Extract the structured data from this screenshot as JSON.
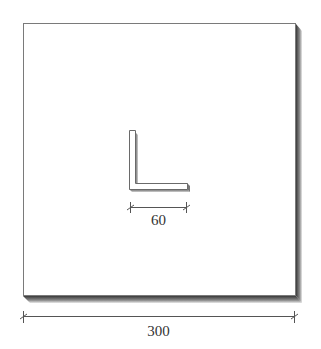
{
  "diagram": {
    "colors": {
      "background": "#ffffff",
      "plate_fill": "#ffffff",
      "plate_edge": "#7a7a7a",
      "shadow": "#555555",
      "dimension_line": "#555555",
      "text": "#333333"
    },
    "dimensions": {
      "plate_width_label": "300",
      "profile_width_label": "60"
    }
  }
}
